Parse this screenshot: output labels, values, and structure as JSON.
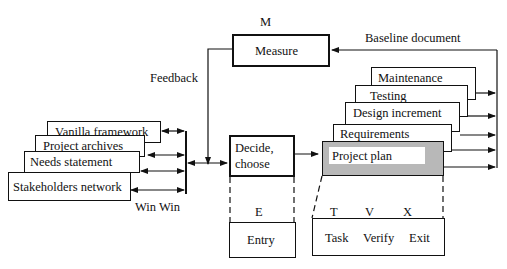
{
  "diagram": {
    "measure": {
      "letter": "M",
      "label": "Measure"
    },
    "baseline_label": "Baseline document",
    "feedback_label": "Feedback",
    "winwin_label": "Win Win",
    "inputs": [
      {
        "label": "Vanilla framework"
      },
      {
        "label": "Project archives"
      },
      {
        "label": "Needs statement"
      },
      {
        "label": "Stakeholders network"
      }
    ],
    "decide": {
      "label_line1": "Decide,",
      "label_line2": "choose"
    },
    "entry": {
      "letter": "E",
      "label": "Entry"
    },
    "stack": [
      {
        "label": "Maintenance"
      },
      {
        "label": "Testing"
      },
      {
        "label": "Design increment"
      },
      {
        "label": "Requirements"
      },
      {
        "label": "Project plan"
      }
    ],
    "tvx": {
      "letters": [
        "T",
        "V",
        "X"
      ],
      "labels": [
        "Task",
        "Verify",
        "Exit"
      ]
    },
    "colors": {
      "line": "#111111",
      "plan_fill": "#b8b8b8",
      "plan_label_bg": "#ffffff"
    }
  }
}
